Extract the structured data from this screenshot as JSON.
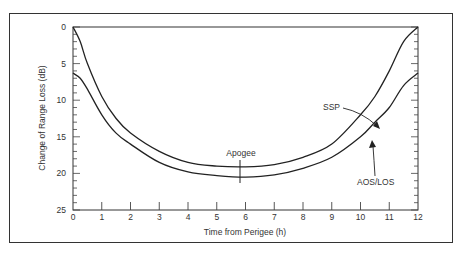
{
  "chart_data": {
    "type": "line",
    "title": "",
    "xlabel": "Time from Perigee (h)",
    "ylabel": "Change of Range Loss (dB)",
    "xlim": [
      0,
      12
    ],
    "ylim": [
      0,
      25
    ],
    "y_inverted": true,
    "x_ticks": [
      "0",
      "1",
      "2",
      "3",
      "4",
      "5",
      "6",
      "7",
      "8",
      "9",
      "10",
      "11",
      "12"
    ],
    "y_ticks": [
      "0",
      "5",
      "10",
      "15",
      "20",
      "25"
    ],
    "grid": false,
    "legend": "none (curves labeled by annotation arrows)",
    "series": [
      {
        "name": "SSP",
        "x": [
          0,
          0.25,
          0.5,
          1,
          1.5,
          2,
          3,
          4,
          5,
          6,
          7,
          8,
          9,
          10,
          10.5,
          11,
          11.5,
          12
        ],
        "values": [
          0,
          2,
          5,
          9.5,
          12.5,
          14.5,
          17,
          18.5,
          19,
          19.1,
          18.8,
          17.8,
          16,
          12,
          9.5,
          6,
          2,
          0
        ]
      },
      {
        "name": "AOS/LOS",
        "x": [
          0,
          0.25,
          0.5,
          1,
          1.5,
          2,
          3,
          4,
          5,
          6,
          7,
          8,
          9,
          10,
          10.5,
          11,
          11.5,
          12
        ],
        "values": [
          6.3,
          7,
          8.5,
          12,
          14.5,
          16,
          18.5,
          19.8,
          20.3,
          20.5,
          20.2,
          19.3,
          17.8,
          15,
          13,
          11,
          8,
          6.3
        ]
      }
    ],
    "annotations": [
      {
        "text": "SSP",
        "points_to": "SSP curve near t=10.3"
      },
      {
        "text": "AOS/LOS",
        "points_to": "AOS/LOS curve near t=10.2"
      },
      {
        "text": "Apogee",
        "marker": "vertical tick at t≈5.8"
      }
    ]
  },
  "labels": {
    "xlabel": "Time from Perigee (h)",
    "ylabel": "Change of Range Loss (dB)",
    "ssp": "SSP",
    "aoslos": "AOS/LOS",
    "apogee": "Apogee",
    "x_ticks": [
      "0",
      "1",
      "2",
      "3",
      "4",
      "5",
      "6",
      "7",
      "8",
      "9",
      "10",
      "11",
      "12"
    ],
    "y_ticks": [
      "0",
      "5",
      "10",
      "15",
      "20",
      "25"
    ]
  }
}
